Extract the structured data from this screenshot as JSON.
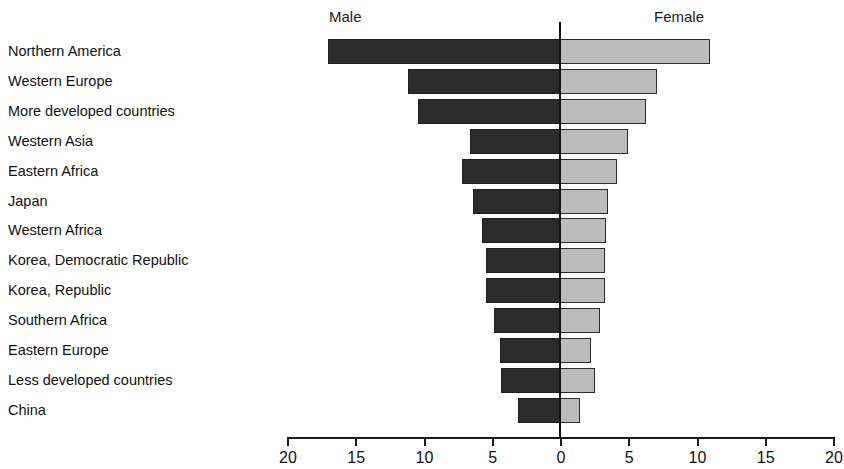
{
  "chart_data": {
    "type": "bar",
    "orientation": "horizontal",
    "subtype": "diverging-pyramid",
    "title": "",
    "xlabel": "",
    "ylabel": "",
    "grid": false,
    "legend_position": "top",
    "axis": {
      "left_header": "Male",
      "right_header": "Female",
      "tick_labels": [
        "20",
        "15",
        "10",
        "5",
        "0",
        "5",
        "10",
        "15",
        "20"
      ],
      "tick_values": [
        20,
        15,
        10,
        5,
        0,
        5,
        10,
        15,
        20
      ],
      "max": 20,
      "min": 0,
      "step": 5
    },
    "categories": [
      "Northern America",
      "Western Europe",
      "More developed countries",
      "Western Asia",
      "Eastern Africa",
      "Japan",
      "Western Africa",
      "Korea, Democratic Republic",
      "Korea, Republic",
      "Southern Africa",
      "Eastern Europe",
      "Less developed countries",
      "China"
    ],
    "series": [
      {
        "name": "Male",
        "color": "#2b2b2b",
        "values": [
          17.0,
          11.1,
          10.4,
          6.6,
          7.2,
          6.4,
          5.7,
          5.4,
          5.4,
          4.8,
          4.4,
          4.3,
          3.1
        ]
      },
      {
        "name": "Female",
        "color": "#bcbcbc",
        "values": [
          11.0,
          7.1,
          6.3,
          5.0,
          4.2,
          3.5,
          3.4,
          3.3,
          3.3,
          2.9,
          2.3,
          2.6,
          1.5
        ]
      }
    ]
  }
}
